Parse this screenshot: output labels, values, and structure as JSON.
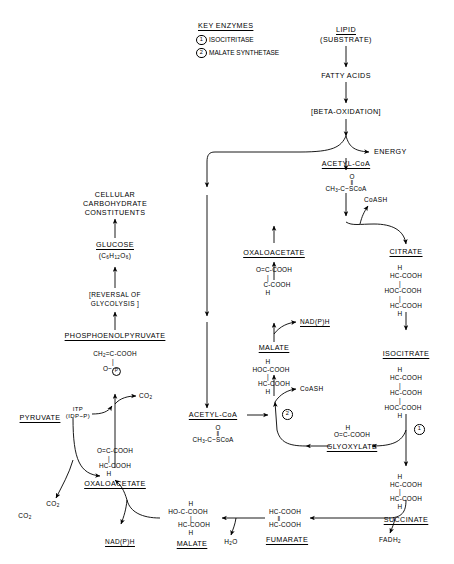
{
  "diagram": {
    "key_enzymes": {
      "heading": "KEY ENZYMES",
      "items": [
        {
          "number": "1",
          "name": "ISOCITRITASE"
        },
        {
          "number": "2",
          "name": "MALATE SYNTHETASE"
        }
      ]
    },
    "nodes": {
      "lipid": {
        "line1": "LIPID",
        "line2": "(SUBSTRATE)"
      },
      "fatty_acids": "FATTY ACIDS",
      "beta_oxidation": "[BETA-OXIDATION]",
      "energy": "ENERGY",
      "acetyl_coa_top": {
        "label": "ACETYL-CoA",
        "o": "O",
        "bond": "‖",
        "formula": "CH3-C~SCoA"
      },
      "coash_top": "CoASH",
      "citrate": {
        "label": "CITRATE",
        "l1": "H",
        "l2": "HC-COOH",
        "l3": "HOC-COOH",
        "l4": "HC-COOH",
        "l5": "H",
        "b1": "|",
        "b2": "|"
      },
      "isocitrate": {
        "label": "ISOCITRATE",
        "l1": "H",
        "l2": "HC-COOH",
        "l3": "HC-COOH",
        "l4": "HOC-COOH",
        "l5": "H",
        "b1": "|",
        "b2": "|"
      },
      "succinate": {
        "label": "SUCCINATE",
        "l1": "H",
        "l2": "HC-COOH",
        "l3": "HC-COOH",
        "l4": "H",
        "b1": "|"
      },
      "fadh2": "FADH2",
      "fumarate": {
        "label": "FUMARATE",
        "l1": "HC-COOH",
        "bond": "‖",
        "l2": "HC-COOH"
      },
      "water": "H2O",
      "malate_bottom": {
        "label": "MALATE",
        "l1": "H",
        "l2": "HO-C-COOH",
        "l3": "HC-COOH",
        "l4": "H",
        "b1": "|"
      },
      "nadph_bottom": "NAD(P)H",
      "oxaloacetate_bottom": {
        "label": "OXALOACETATE",
        "l1": "O=C-COOH",
        "l2": "HC-COOH",
        "l3": "H",
        "b1": "|"
      },
      "pyruvate": "PYRUVATE",
      "co2_pyruvate": "CO2",
      "co2_pep": "CO2",
      "itp": {
        "l1": "ITP",
        "l2": "(IDP~P)"
      },
      "pep": {
        "label": "PHOSPHOENOLPYRUVATE",
        "l1": "CH2=C-COOH",
        "b1": "|",
        "l2": "O~",
        "p": "P"
      },
      "reversal_glycolysis": {
        "l1": "[REVERSAL OF",
        "l2": "GLYCOLYSIS ]"
      },
      "glucose": {
        "label": "GLUCOSE",
        "formula": "(C6H12O6)"
      },
      "cellular_constituents": {
        "l1": "CELLULAR",
        "l2": "CARBOHYDRATE",
        "l3": "CONSTITUENTS"
      },
      "oxaloacetate_top": {
        "label": "OXALOACETATE",
        "l1": "O=C-COOH",
        "l2": "C-COOH",
        "l3": "H",
        "b1": "|"
      },
      "nadph_top": "NAD(P)H",
      "malate_middle": {
        "label": "MALATE",
        "l1": "H",
        "l2": "HOC-COOH",
        "l3": "HC-COOH",
        "l4": "H",
        "b1": "|"
      },
      "coash_middle": "CoASH",
      "acetyl_coa_bottom": {
        "label": "ACETYL-CoA",
        "o": "O",
        "bond": "‖",
        "formula": "CH3-C~SCoA"
      },
      "glyoxylate": {
        "label": "GLYOXYLATE",
        "l1": "H",
        "l2": "O=C-COOH"
      },
      "enzyme1_marker": "1",
      "enzyme2_marker": "2"
    },
    "colors": {
      "ink": "#000000",
      "background": "#ffffff"
    }
  }
}
